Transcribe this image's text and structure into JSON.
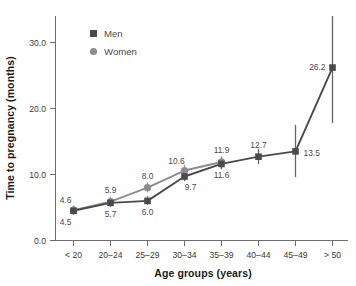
{
  "chart_data": {
    "type": "line",
    "title": "",
    "xlabel": "Age groups (years)",
    "ylabel": "Time to pregnancy (months)",
    "categories": [
      "< 20",
      "20–24",
      "25–29",
      "30–34",
      "35–39",
      "40–44",
      "45–49",
      "> 50"
    ],
    "ylim": [
      0,
      34
    ],
    "yticks": [
      "0.0",
      "10.0",
      "20.0",
      "30.0"
    ],
    "ytick_values": [
      0,
      10,
      20,
      30
    ],
    "grid": false,
    "legend_position": "top-left-inside",
    "series": [
      {
        "name": "Men",
        "color": "#4a4a4a",
        "marker": "square",
        "values": [
          4.5,
          5.7,
          6.0,
          9.7,
          11.6,
          12.7,
          13.5,
          26.2
        ],
        "labels": [
          "4.5",
          "5.7",
          "6.0",
          "9.7",
          "11.6",
          "12.7",
          "13.5",
          "26.2"
        ],
        "error_low": [
          3.9,
          5.1,
          5.4,
          9.0,
          10.8,
          11.6,
          9.6,
          17.8
        ],
        "error_high": [
          5.2,
          6.4,
          6.7,
          10.5,
          12.5,
          13.9,
          17.5,
          34.0
        ]
      },
      {
        "name": "Women",
        "color": "#8c8c8c",
        "marker": "circle",
        "values": [
          4.6,
          5.9,
          8.0,
          10.6,
          11.9,
          null,
          null,
          null
        ],
        "labels": [
          "4.6",
          "5.9",
          "8.0",
          "10.6",
          "11.9",
          "",
          "",
          ""
        ],
        "error_low": [
          4.0,
          5.3,
          7.3,
          9.8,
          11.0,
          null,
          null,
          null
        ],
        "error_high": [
          5.3,
          6.6,
          8.8,
          11.5,
          12.8,
          null,
          null,
          null
        ]
      }
    ],
    "annotations": [
      {
        "text": "4.6",
        "series": "Women",
        "category": "< 20",
        "placement": "above-left"
      },
      {
        "text": "4.5",
        "series": "Men",
        "category": "< 20",
        "placement": "below-left"
      },
      {
        "text": "5.9",
        "series": "Women",
        "category": "20–24",
        "placement": "above"
      },
      {
        "text": "5.7",
        "series": "Men",
        "category": "20–24",
        "placement": "below"
      },
      {
        "text": "8.0",
        "series": "Women",
        "category": "25–29",
        "placement": "above"
      },
      {
        "text": "6.0",
        "series": "Men",
        "category": "25–29",
        "placement": "below"
      },
      {
        "text": "10.6",
        "series": "Women",
        "category": "30–34",
        "placement": "above-left"
      },
      {
        "text": "9.7",
        "series": "Men",
        "category": "30–34",
        "placement": "below-right"
      },
      {
        "text": "11.9",
        "series": "Women",
        "category": "35–39",
        "placement": "above"
      },
      {
        "text": "11.6",
        "series": "Men",
        "category": "35–39",
        "placement": "below"
      },
      {
        "text": "12.7",
        "series": "Men",
        "category": "40–44",
        "placement": "above"
      },
      {
        "text": "13.5",
        "series": "Men",
        "category": "45–49",
        "placement": "right"
      },
      {
        "text": "26.2",
        "series": "Men",
        "category": "> 50",
        "placement": "left"
      }
    ]
  },
  "legend": {
    "entries": [
      {
        "label": "Men",
        "marker": "square",
        "color": "#4a4a4a"
      },
      {
        "label": "Women",
        "marker": "circle",
        "color": "#8c8c8c"
      }
    ]
  },
  "axes": {
    "y_title": "Time to pregnancy (months)",
    "x_title": "Age groups (years)",
    "y_tick_labels": [
      "30.0",
      "20.0",
      "10.0",
      "0.0"
    ],
    "x_tick_labels": [
      "< 20",
      "20–24",
      "25–29",
      "30–34",
      "35–39",
      "40–44",
      "45–49",
      "> 50"
    ]
  },
  "value_labels": {
    "women": [
      "4.6",
      "5.9",
      "8.0",
      "10.6",
      "11.9"
    ],
    "men": [
      "4.5",
      "5.7",
      "6.0",
      "9.7",
      "11.6",
      "12.7",
      "13.5",
      "26.2"
    ]
  }
}
